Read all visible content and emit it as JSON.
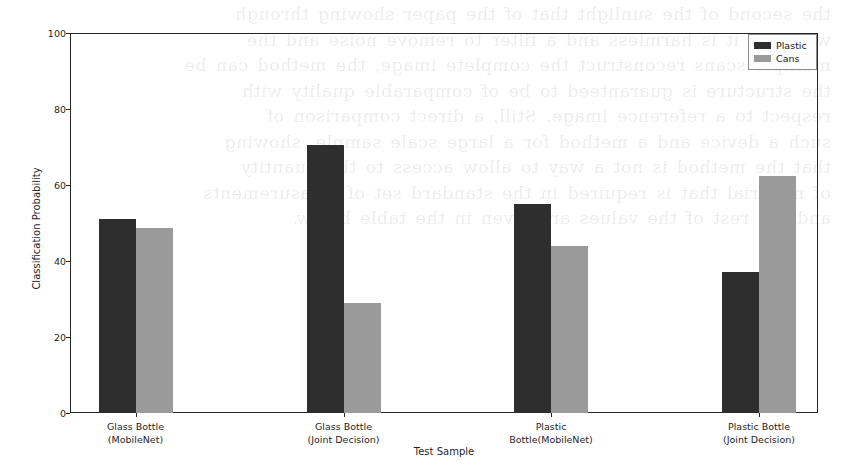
{
  "chart_data": {
    "type": "bar",
    "title": "",
    "xlabel": "Test Sample",
    "ylabel": "Classification Probability",
    "categories": [
      "Glass Bottle\n(MobileNet)",
      "Glass Bottle\n(Joint Decision)",
      "Plastic\nBottle(MobileNet)",
      "Plastic Bottle\n(Joint Decision)"
    ],
    "category_lines": [
      [
        "Glass Bottle",
        "(MobileNet)"
      ],
      [
        "Glass Bottle",
        "(Joint Decision)"
      ],
      [
        "Plastic",
        "Bottle(MobileNet)"
      ],
      [
        "Plastic Bottle",
        "(Joint Decision)"
      ]
    ],
    "series": [
      {
        "name": "Plastic",
        "color": "#2e2e2e",
        "values": [
          51,
          70.5,
          55,
          37
        ]
      },
      {
        "name": "Cans",
        "color": "#9a9a9a",
        "values": [
          48.7,
          29,
          44,
          62.5
        ]
      }
    ],
    "ylim": [
      0,
      100
    ],
    "yticks": [
      0,
      20,
      40,
      60,
      80,
      100
    ],
    "ytick_labels": [
      "0",
      "20",
      "40",
      "60",
      "80",
      "100"
    ],
    "grid": false,
    "legend_position": "upper right"
  },
  "legend": {
    "entries": [
      {
        "label": "Plastic",
        "color": "#2e2e2e"
      },
      {
        "label": "Cans",
        "color": "#9a9a9a"
      }
    ]
  },
  "background": {
    "bleed_text": "the second of the sunlight that of the paper showing through\nwe think it is harmless and a filter to remove noise and the\nmultiple scans reconstruct the complete image, the method can be\nthe structure is guaranteed to be of comparable quality with\nrespect to a reference image. Still, a direct comparison of\nsuch a device and a method for a large scale sample, showing\nthat the method is not a way to allow access to the quantity\nof material that is required in the standard set of measurements\nand the rest of the values are given in the table below."
  }
}
